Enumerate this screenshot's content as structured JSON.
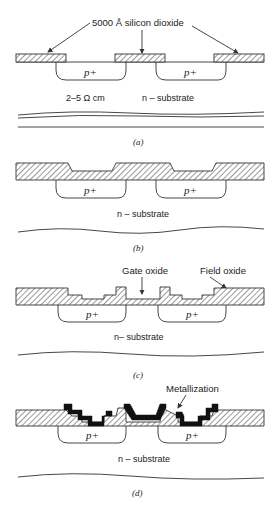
{
  "figure": {
    "panels": [
      {
        "id": "a",
        "caption": "(a)",
        "labels": {
          "oxide": "5000 Å silicon dioxide",
          "resistivity": "2–5 Ω   cm",
          "substrate": "n – substrate",
          "p_region_1": "p+",
          "p_region_2": "p+"
        }
      },
      {
        "id": "b",
        "caption": "(b)",
        "labels": {
          "substrate": "n – substrate",
          "p_region_1": "p+",
          "p_region_2": "p+"
        }
      },
      {
        "id": "c",
        "caption": "(c)",
        "labels": {
          "gate_oxide": "Gate oxide",
          "field_oxide": "Field oxide",
          "substrate": "n– substrate",
          "p_region_1": "p+",
          "p_region_2": "p+"
        }
      },
      {
        "id": "d",
        "caption": "(d)",
        "labels": {
          "metallization": "Metallization",
          "substrate": "n – substrate",
          "p_region_1": "p+",
          "p_region_2": "p+"
        }
      }
    ],
    "colors": {
      "line": "#333333",
      "metal": "#111111",
      "background": "#ffffff"
    }
  }
}
